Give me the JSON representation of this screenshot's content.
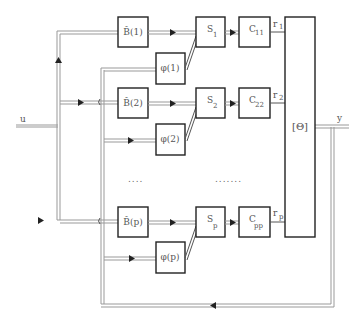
{
  "diagram": {
    "input_label": "u",
    "output_label": "y",
    "theta_block_label": "[Θ]",
    "rows": [
      {
        "b_label": "B̂(1)",
        "phi_label": "φ(1)",
        "s_label": "S",
        "s_sub": "1",
        "c_label": "C",
        "c_sub": "11",
        "r_label": "r",
        "r_sub": "1"
      },
      {
        "b_label": "B̂(2)",
        "phi_label": "φ(2)",
        "s_label": "S",
        "s_sub": "2",
        "c_label": "C",
        "c_sub": "22",
        "r_label": "r",
        "r_sub": "2"
      },
      {
        "b_label": "B̂(p)",
        "phi_label": "φ(p)",
        "s_label": "S",
        "s_sub": "p",
        "c_label": "C",
        "c_sub": "pp",
        "r_label": "r",
        "r_sub": "p"
      }
    ],
    "ellipsis_left": "....",
    "ellipsis_right": ".......",
    "colors": {
      "block_stroke": "#222222",
      "wire": "#999999",
      "background": "#ffffff"
    }
  }
}
